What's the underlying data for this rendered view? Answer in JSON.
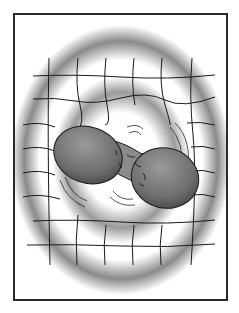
{
  "illustration": {
    "subject": "two merging spheres on a warped spacetime grid",
    "colors": {
      "frame": "#2a2a2a",
      "background": "#ffffff",
      "halo_gray": "#8a8a8a",
      "sphere_fill": "#7a7a7a",
      "grid_line": "#1a1a1a"
    }
  }
}
